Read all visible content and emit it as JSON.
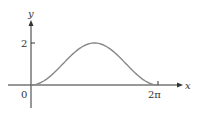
{
  "chart_data": {
    "type": "line",
    "title": "",
    "function": "y = 1 - cos(x)",
    "xlabel": "x",
    "ylabel": "y",
    "x_ticks": [
      {
        "value": 0,
        "label": "0"
      },
      {
        "value": 6.2832,
        "label": "2π"
      }
    ],
    "y_ticks": [
      {
        "value": 2,
        "label": "2"
      }
    ],
    "xlim": [
      0,
      6.2832
    ],
    "ylim": [
      0,
      2
    ],
    "grid": false,
    "legend": null,
    "series": [
      {
        "name": "curve",
        "x": [
          0,
          0.785,
          1.571,
          2.356,
          3.1416,
          3.927,
          4.712,
          5.498,
          6.2832
        ],
        "y": [
          0,
          0.29,
          1,
          1.71,
          2,
          1.71,
          1,
          0.29,
          0
        ]
      }
    ],
    "colors": {
      "curve": "#888888",
      "axes": "#333333"
    }
  },
  "labels": {
    "x_axis": "x",
    "y_axis": "y",
    "origin": "0",
    "y_tick_2": "2",
    "x_tick_2pi": "2π"
  }
}
